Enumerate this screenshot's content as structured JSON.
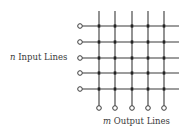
{
  "diagram": {
    "input_label": {
      "var": "n",
      "text": "Input Lines"
    },
    "output_label": {
      "var": "m",
      "text": "Output Lines"
    },
    "inputs_count": 5,
    "outputs_count": 5,
    "geometry": {
      "input_circle_x": 80,
      "row_y": [
        26,
        42,
        58,
        73,
        89
      ],
      "col_x": [
        99,
        115,
        132,
        148,
        164
      ],
      "vertical_top": 11,
      "horizontal_end": 179,
      "output_circle_y": 108,
      "circle_r": 2.3
    },
    "colors": {
      "line": "#3a3a3a",
      "crosspoint": "#222222",
      "text": "#3a3a3a"
    }
  }
}
